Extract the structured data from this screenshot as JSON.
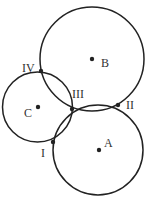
{
  "diagram": {
    "stroke_color": "#222222",
    "circles": [
      {
        "id": "A",
        "cx": 98,
        "cy": 150,
        "r": 45
      },
      {
        "id": "B",
        "cx": 92,
        "cy": 59,
        "r": 52
      },
      {
        "id": "C",
        "cx": 37.5,
        "cy": 107,
        "r": 35
      }
    ],
    "centers": [
      {
        "label": "A",
        "x": 99,
        "y": 150,
        "lx": 104,
        "ly": 147
      },
      {
        "label": "B",
        "x": 92,
        "y": 59,
        "lx": 101,
        "ly": 67
      },
      {
        "label": "C",
        "x": 38,
        "y": 107,
        "lx": 24,
        "ly": 117
      }
    ],
    "intersections": [
      {
        "label": "I",
        "x": 53,
        "y": 142,
        "lx": 41,
        "ly": 157
      },
      {
        "label": "II",
        "x": 118,
        "y": 105,
        "lx": 126,
        "ly": 109
      },
      {
        "label": "III",
        "x": 72,
        "y": 109,
        "lx": 72,
        "ly": 98
      },
      {
        "label": "IV",
        "x": 41,
        "y": 71,
        "lx": 22,
        "ly": 72
      }
    ]
  }
}
